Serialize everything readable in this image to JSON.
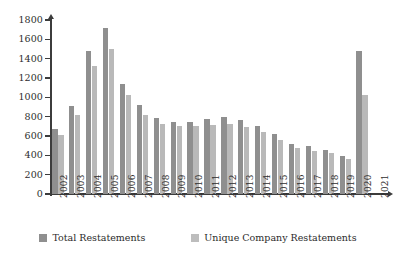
{
  "chart_data": {
    "type": "bar",
    "title": "",
    "subtitle": "",
    "xlabel": "",
    "ylabel": "",
    "ylim": [
      0,
      1800
    ],
    "ytick_step": 200,
    "yticks": [
      0,
      200,
      400,
      600,
      800,
      1000,
      1200,
      1400,
      1600,
      1800
    ],
    "grid": false,
    "legend_position": "bottom",
    "categories": [
      "2002",
      "2003",
      "2004",
      "2005",
      "2006",
      "2007",
      "2008",
      "2009",
      "2010",
      "2011",
      "2012",
      "2013",
      "2014",
      "2015",
      "2016",
      "2017",
      "2018",
      "2019",
      "2020",
      "2021"
    ],
    "series": [
      {
        "name": "Total Restatements",
        "color": "#8f8f8f",
        "values": [
          670,
          910,
          1480,
          1720,
          1140,
          920,
          790,
          740,
          750,
          780,
          800,
          770,
          700,
          620,
          520,
          500,
          460,
          390,
          1480,
          0
        ]
      },
      {
        "name": "Unique Company Restatements",
        "color": "#b9b9b9",
        "values": [
          610,
          820,
          1320,
          1500,
          1020,
          820,
          720,
          700,
          700,
          710,
          720,
          690,
          640,
          560,
          480,
          450,
          420,
          360,
          1020,
          0
        ]
      }
    ]
  },
  "axis": {
    "y_labels": [
      "1800",
      "1600",
      "1400",
      "1200",
      "1000",
      "800",
      "600",
      "400",
      "200",
      "0"
    ]
  },
  "legend": {
    "items": [
      {
        "label": "Total Restatements",
        "swatch": "total"
      },
      {
        "label": "Unique Company Restatements",
        "swatch": "unique"
      }
    ]
  }
}
